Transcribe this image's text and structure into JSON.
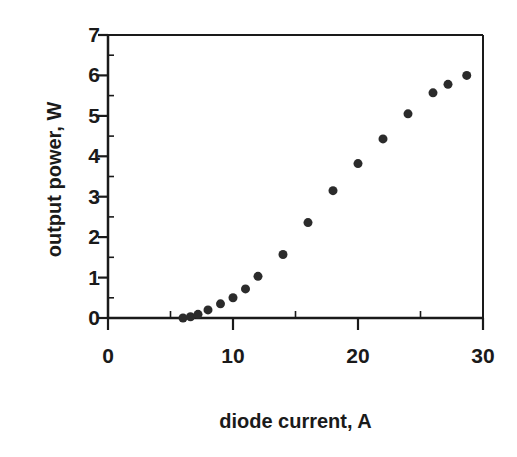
{
  "chart_data": {
    "type": "scatter",
    "title": "",
    "xlabel": "diode current, A",
    "ylabel": "output power, W",
    "xlim": [
      0,
      30
    ],
    "ylim": [
      0,
      7
    ],
    "xticks": [
      0,
      10,
      20,
      30
    ],
    "yticks": [
      0,
      1,
      2,
      3,
      4,
      5,
      6,
      7
    ],
    "xtick_labels": [
      "0",
      "10",
      "20",
      "30"
    ],
    "ytick_labels": [
      "0",
      "1",
      "2",
      "3",
      "4",
      "5",
      "6",
      "7"
    ],
    "x_minor_tick_interval": 5,
    "y_minor_tick_interval": 0.5,
    "grid": false,
    "legend": null,
    "marker": "filled-circle",
    "marker_color": "#2b2b2b",
    "marker_size_px": 9,
    "axis_color": "#1a1a1a",
    "background_color": "#ffffff",
    "series": [
      {
        "name": "output power",
        "x": [
          6.0,
          6.6,
          7.2,
          8.0,
          9.0,
          10.0,
          11.0,
          12.0,
          14.0,
          16.0,
          18.0,
          20.0,
          22.0,
          24.0,
          26.0,
          27.2,
          28.7
        ],
        "y": [
          0.0,
          0.03,
          0.09,
          0.2,
          0.35,
          0.5,
          0.72,
          1.03,
          1.57,
          2.36,
          3.15,
          3.82,
          4.43,
          5.05,
          5.57,
          5.78,
          6.0
        ]
      }
    ]
  },
  "figure": {
    "xlabel": "diode current, A",
    "ylabel": "output power, W"
  }
}
